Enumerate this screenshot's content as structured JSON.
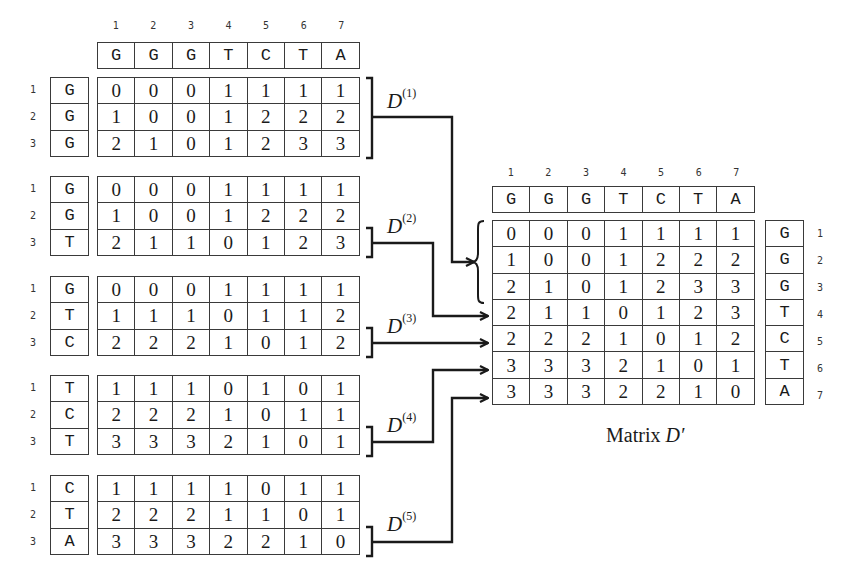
{
  "sequence": {
    "column_numbers": [
      "1",
      "2",
      "3",
      "4",
      "5",
      "6",
      "7"
    ],
    "letters": [
      "G",
      "G",
      "G",
      "T",
      "C",
      "T",
      "A"
    ]
  },
  "blocks": [
    {
      "label_base": "D",
      "label_sup": "(1)",
      "row_numbers": [
        "1",
        "2",
        "3"
      ],
      "row_letters": [
        "G",
        "G",
        "G"
      ],
      "rows": [
        [
          "0",
          "0",
          "0",
          "1",
          "1",
          "1",
          "1"
        ],
        [
          "1",
          "0",
          "0",
          "1",
          "2",
          "2",
          "2"
        ],
        [
          "2",
          "1",
          "0",
          "1",
          "2",
          "3",
          "3"
        ]
      ]
    },
    {
      "label_base": "D",
      "label_sup": "(2)",
      "row_numbers": [
        "1",
        "2",
        "3"
      ],
      "row_letters": [
        "G",
        "G",
        "T"
      ],
      "rows": [
        [
          "0",
          "0",
          "0",
          "1",
          "1",
          "1",
          "1"
        ],
        [
          "1",
          "0",
          "0",
          "1",
          "2",
          "2",
          "2"
        ],
        [
          "2",
          "1",
          "1",
          "0",
          "1",
          "2",
          "3"
        ]
      ]
    },
    {
      "label_base": "D",
      "label_sup": "(3)",
      "row_numbers": [
        "1",
        "2",
        "3"
      ],
      "row_letters": [
        "G",
        "T",
        "C"
      ],
      "rows": [
        [
          "0",
          "0",
          "0",
          "1",
          "1",
          "1",
          "1"
        ],
        [
          "1",
          "1",
          "1",
          "0",
          "1",
          "1",
          "2"
        ],
        [
          "2",
          "2",
          "2",
          "1",
          "0",
          "1",
          "2"
        ]
      ]
    },
    {
      "label_base": "D",
      "label_sup": "(4)",
      "row_numbers": [
        "1",
        "2",
        "3"
      ],
      "row_letters": [
        "T",
        "C",
        "T"
      ],
      "rows": [
        [
          "1",
          "1",
          "1",
          "0",
          "1",
          "0",
          "1"
        ],
        [
          "2",
          "2",
          "2",
          "1",
          "0",
          "1",
          "1"
        ],
        [
          "3",
          "3",
          "3",
          "2",
          "1",
          "0",
          "1"
        ]
      ]
    },
    {
      "label_base": "D",
      "label_sup": "(5)",
      "row_numbers": [
        "1",
        "2",
        "3"
      ],
      "row_letters": [
        "C",
        "T",
        "A"
      ],
      "rows": [
        [
          "1",
          "1",
          "1",
          "1",
          "0",
          "1",
          "1"
        ],
        [
          "2",
          "2",
          "2",
          "1",
          "1",
          "0",
          "1"
        ],
        [
          "3",
          "3",
          "3",
          "2",
          "2",
          "1",
          "0"
        ]
      ]
    }
  ],
  "result": {
    "caption_prefix": "Matrix ",
    "caption_symbol": "D′",
    "column_numbers": [
      "1",
      "2",
      "3",
      "4",
      "5",
      "6",
      "7"
    ],
    "column_letters": [
      "G",
      "G",
      "G",
      "T",
      "C",
      "T",
      "A"
    ],
    "row_letters": [
      "G",
      "G",
      "G",
      "T",
      "C",
      "T",
      "A"
    ],
    "row_numbers": [
      "1",
      "2",
      "3",
      "4",
      "5",
      "6",
      "7"
    ],
    "rows": [
      [
        "0",
        "0",
        "0",
        "1",
        "1",
        "1",
        "1"
      ],
      [
        "1",
        "0",
        "0",
        "1",
        "2",
        "2",
        "2"
      ],
      [
        "2",
        "1",
        "0",
        "1",
        "2",
        "3",
        "3"
      ],
      [
        "2",
        "1",
        "1",
        "0",
        "1",
        "2",
        "3"
      ],
      [
        "2",
        "2",
        "2",
        "1",
        "0",
        "1",
        "2"
      ],
      [
        "3",
        "3",
        "3",
        "2",
        "1",
        "0",
        "1"
      ],
      [
        "3",
        "3",
        "3",
        "2",
        "2",
        "1",
        "0"
      ]
    ]
  }
}
